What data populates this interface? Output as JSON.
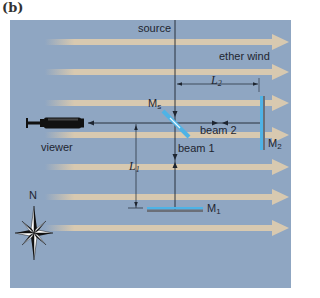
{
  "figure": {
    "panel_label": "(b)",
    "colors": {
      "background": "#8fa6c2",
      "wind_arrow": "#d8c9b0",
      "mirror_blue": "#4eb3e6",
      "mirror_gray": "#6b6f78",
      "line": "#1e2530"
    }
  },
  "labels": {
    "source": "source",
    "ether_wind": "ether wind",
    "L2": "L",
    "L2_sub": "2",
    "Ms": "M",
    "Ms_sub": "s",
    "beam2": "beam 2",
    "beam1": "beam 1",
    "M2": "M",
    "M2_sub": "2",
    "viewer": "viewer",
    "L1": "L",
    "L1_sub": "1",
    "M1": "M",
    "M1_sub": "1",
    "compass_north": "N"
  }
}
